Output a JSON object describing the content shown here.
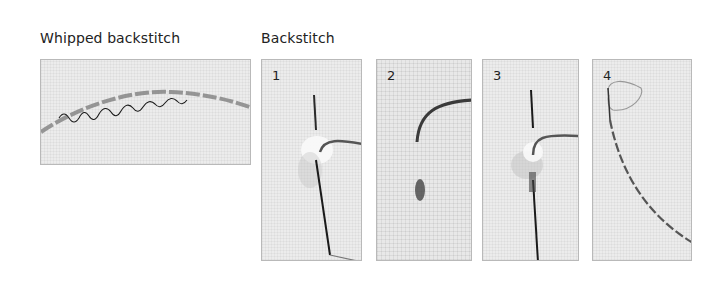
{
  "captions": {
    "whipped": "Whipped backstitch",
    "backstitch": "Backstitch"
  },
  "steps": [
    {
      "number": "1"
    },
    {
      "number": "2"
    },
    {
      "number": "3"
    },
    {
      "number": "4"
    }
  ],
  "colors": {
    "background": "#ffffff",
    "fabric": "#ececec",
    "thread": "#4a4a4a",
    "whip_thread": "#1a1a1a",
    "needle": "#2a2a2a",
    "panel_border": "#b9b9b9"
  }
}
